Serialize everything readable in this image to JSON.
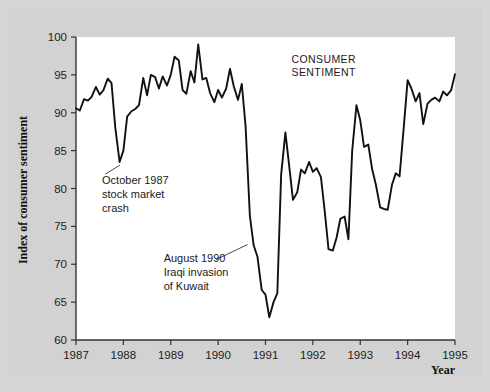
{
  "figure": {
    "background_color": "#d2d2d2",
    "plot_background_color": "#ffffff",
    "line_color": "#111111",
    "axis_color": "#333333"
  },
  "chart_data": {
    "type": "line",
    "title": "",
    "subtitle": "",
    "xlabel": "Year",
    "ylabel": "Index of consumer sentiment",
    "xlim": [
      1987,
      1995
    ],
    "ylim": [
      60,
      100
    ],
    "grid": false,
    "legend_position": "inline-annotation",
    "x_tick_labels": [
      "1987",
      "1988",
      "1989",
      "1990",
      "1991",
      "1992",
      "1993",
      "1994",
      "1995"
    ],
    "x_ticks": [
      1987,
      1988,
      1989,
      1990,
      1991,
      1992,
      1993,
      1994,
      1995
    ],
    "y_tick_labels": [
      "60",
      "65",
      "70",
      "75",
      "80",
      "85",
      "90",
      "95",
      "100"
    ],
    "y_ticks": [
      60,
      65,
      70,
      75,
      80,
      85,
      90,
      95,
      100
    ],
    "series": [
      {
        "name": "CONSUMER SENTIMENT",
        "label_position": {
          "x": 1991.55,
          "y": 96.6
        },
        "x": [
          1987.0,
          1987.08,
          1987.17,
          1987.25,
          1987.33,
          1987.42,
          1987.5,
          1987.58,
          1987.67,
          1987.75,
          1987.83,
          1987.92,
          1988.0,
          1988.08,
          1988.17,
          1988.25,
          1988.33,
          1988.42,
          1988.5,
          1988.58,
          1988.67,
          1988.75,
          1988.83,
          1988.92,
          1989.0,
          1989.08,
          1989.17,
          1989.25,
          1989.33,
          1989.42,
          1989.5,
          1989.58,
          1989.67,
          1989.75,
          1989.83,
          1989.92,
          1990.0,
          1990.08,
          1990.17,
          1990.25,
          1990.33,
          1990.42,
          1990.5,
          1990.58,
          1990.67,
          1990.75,
          1990.83,
          1990.92,
          1991.0,
          1991.08,
          1991.17,
          1991.25,
          1991.33,
          1991.42,
          1991.5,
          1991.58,
          1991.67,
          1991.75,
          1991.83,
          1991.92,
          1992.0,
          1992.08,
          1992.17,
          1992.25,
          1992.33,
          1992.42,
          1992.5,
          1992.58,
          1992.67,
          1992.75,
          1992.83,
          1992.92,
          1993.0,
          1993.08,
          1993.17,
          1993.25,
          1993.33,
          1993.42,
          1993.5,
          1993.58,
          1993.67,
          1993.75,
          1993.83,
          1993.92,
          1994.0,
          1994.08,
          1994.17,
          1994.25,
          1994.33,
          1994.42,
          1994.5,
          1994.58,
          1994.67,
          1994.75,
          1994.83,
          1994.92,
          1995.0
        ],
        "values": [
          90.6,
          90.3,
          91.8,
          91.6,
          92.1,
          93.4,
          92.4,
          93.0,
          94.5,
          93.9,
          88.0,
          83.5,
          85.0,
          89.5,
          90.2,
          90.5,
          91.0,
          94.6,
          92.3,
          95.0,
          94.7,
          93.2,
          94.8,
          93.6,
          95.0,
          97.4,
          96.9,
          93.0,
          92.5,
          95.5,
          94.0,
          99.0,
          94.4,
          94.6,
          92.6,
          91.4,
          93.0,
          92.0,
          93.2,
          95.8,
          93.5,
          91.7,
          93.8,
          88.2,
          76.4,
          72.5,
          71.0,
          66.6,
          66.0,
          63.0,
          65.0,
          66.2,
          81.8,
          87.4,
          83.0,
          78.5,
          79.5,
          82.5,
          82.0,
          83.5,
          82.2,
          82.7,
          81.5,
          77.0,
          72.0,
          71.8,
          73.5,
          76.0,
          76.3,
          73.3,
          85.0,
          91.0,
          89.0,
          85.5,
          85.8,
          82.6,
          80.5,
          77.5,
          77.3,
          77.2,
          80.5,
          82.0,
          81.6,
          88.2,
          94.3,
          93.2,
          91.5,
          92.6,
          88.5,
          91.2,
          91.7,
          92.0,
          91.5,
          92.8,
          92.3,
          93.0,
          95.1
        ]
      }
    ],
    "annotations": [
      {
        "name": "october-1987-crash",
        "lines": [
          "October 1987",
          "stock market",
          "crash"
        ],
        "text_x": 1987.55,
        "text_y": 80.6,
        "leader_from": {
          "x": 1987.62,
          "y": 81.9
        },
        "leader_to": {
          "x": 1987.93,
          "y": 83.1
        }
      },
      {
        "name": "august-1990-iraq-invasion",
        "lines": [
          "August 1990",
          "Iraqi invasion",
          "of Kuwait"
        ],
        "text_x": 1988.85,
        "text_y": 70.3,
        "leader_from": {
          "x": 1989.95,
          "y": 70.6
        },
        "leader_to": {
          "x": 1990.62,
          "y": 72.6
        }
      }
    ]
  }
}
